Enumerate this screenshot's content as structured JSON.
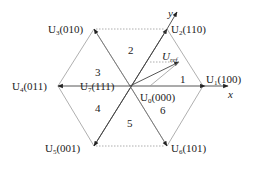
{
  "diagram": {
    "colors": {
      "hexagon_edge": "#b0b0b0",
      "vector": "#333333",
      "dotted": "#999999",
      "text": "#222222"
    },
    "vectors": [
      {
        "id": "U1",
        "name": "U",
        "sub": "1",
        "code": "(100)"
      },
      {
        "id": "U2",
        "name": "U",
        "sub": "2",
        "code": "(110)"
      },
      {
        "id": "U3",
        "name": "U",
        "sub": "3",
        "code": "(010)"
      },
      {
        "id": "U4",
        "name": "U",
        "sub": "4",
        "code": "(011)"
      },
      {
        "id": "U5",
        "name": "U",
        "sub": "5",
        "code": "(001)"
      },
      {
        "id": "U6",
        "name": "U",
        "sub": "6",
        "code": "(101)"
      },
      {
        "id": "U7",
        "name": "U",
        "sub": "7",
        "code": "(111)"
      },
      {
        "id": "U0",
        "name": "U",
        "sub": "0",
        "code": "(000)"
      }
    ],
    "reference": {
      "name": "U",
      "sub": "ref"
    },
    "axes": {
      "x": "x",
      "y": "y"
    },
    "sectors": [
      "1",
      "2",
      "3",
      "4",
      "5",
      "6"
    ]
  }
}
